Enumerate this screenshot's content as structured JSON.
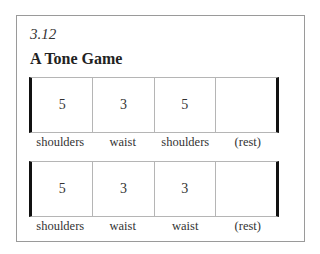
{
  "figure": {
    "number": "3.12",
    "title": "A Tone Game"
  },
  "measures": [
    {
      "cells": [
        "5",
        "3",
        "5",
        ""
      ],
      "labels": [
        "shoulders",
        "waist",
        "shoulders",
        "(rest)"
      ]
    },
    {
      "cells": [
        "5",
        "3",
        "3",
        ""
      ],
      "labels": [
        "shoulders",
        "waist",
        "waist",
        "(rest)"
      ]
    }
  ]
}
